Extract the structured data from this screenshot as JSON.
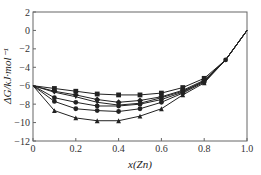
{
  "chart_data": {
    "type": "line",
    "title": "",
    "xlabel": "x(Zn)",
    "ylabel": "ΔG/kJ·mol⁻¹",
    "xlim": [
      0,
      1.0
    ],
    "ylim": [
      -12,
      2
    ],
    "xticks": [
      "0",
      "0.2",
      "0.4",
      "0.6",
      "0.8",
      "1.0"
    ],
    "yticks": [
      "2",
      "0",
      "-2",
      "-4",
      "-6",
      "-8",
      "-10",
      "-12"
    ],
    "grid": false,
    "legend": null,
    "x": [
      0,
      0.1,
      0.2,
      0.3,
      0.4,
      0.5,
      0.6,
      0.7,
      0.8,
      0.9,
      1.0
    ],
    "series": [
      {
        "name": "square",
        "marker": "square",
        "values": [
          -6.0,
          -6.3,
          -6.6,
          -6.9,
          -7.0,
          -7.0,
          -6.8,
          -6.2,
          -5.2,
          -3.2,
          0.0
        ]
      },
      {
        "name": "diamond",
        "marker": "diamond",
        "values": [
          -6.0,
          -6.6,
          -7.0,
          -7.5,
          -7.8,
          -7.6,
          -7.2,
          -6.5,
          -5.4,
          -3.2,
          0.0
        ]
      },
      {
        "name": "down-triangle",
        "marker": "triangle-down",
        "values": [
          -6.0,
          -6.7,
          -7.2,
          -7.8,
          -8.1,
          -7.9,
          -7.3,
          -6.6,
          -5.5,
          -3.2,
          0.0
        ]
      },
      {
        "name": "hexagon",
        "marker": "circle",
        "values": [
          -6.0,
          -7.3,
          -7.8,
          -8.2,
          -8.2,
          -8.0,
          -7.5,
          -6.7,
          -5.5,
          -3.2,
          0.0
        ]
      },
      {
        "name": "circle",
        "marker": "circle",
        "values": [
          -6.0,
          -7.7,
          -8.5,
          -8.7,
          -8.8,
          -8.5,
          -7.8,
          -6.8,
          -5.6,
          -3.2,
          0.0
        ]
      },
      {
        "name": "triangle",
        "marker": "triangle-up",
        "values": [
          -6.0,
          -8.7,
          -9.5,
          -9.8,
          -9.8,
          -9.3,
          -8.5,
          -7.0,
          -5.7,
          -3.2,
          0.0
        ]
      }
    ],
    "colors": {
      "line": "#222222",
      "axis": "#555555"
    }
  }
}
